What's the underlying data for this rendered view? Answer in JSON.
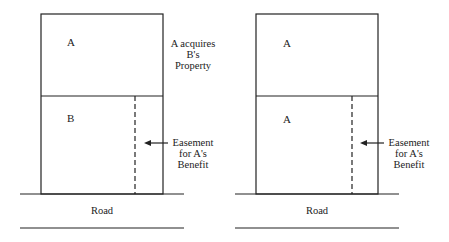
{
  "left_panel": {
    "upper_parcel": "A",
    "lower_parcel": "B",
    "note": [
      "A acquires",
      "B's",
      "Property"
    ],
    "easement_label": [
      "Easement",
      "for A's",
      "Benefit"
    ],
    "road_label": "Road"
  },
  "right_panel": {
    "upper_parcel": "A",
    "lower_parcel": "A",
    "easement_label": [
      "Easement",
      "for A's",
      "Benefit"
    ],
    "road_label": "Road"
  }
}
